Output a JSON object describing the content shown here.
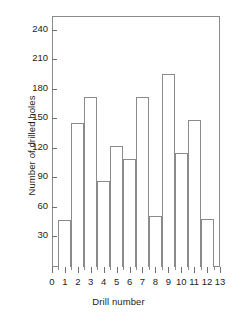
{
  "chart_data": {
    "type": "bar",
    "title": "",
    "xlabel": "Drill number",
    "ylabel": "Number of drilled holes",
    "categories": [
      "1",
      "2",
      "3",
      "4",
      "5",
      "6",
      "7",
      "8",
      "9",
      "10",
      "11",
      "12"
    ],
    "values": [
      47,
      145,
      172,
      86,
      122,
      109,
      172,
      51,
      195,
      115,
      148,
      48
    ],
    "xlim": [
      0,
      13
    ],
    "ylim": [
      0,
      255
    ],
    "yticks": [
      30,
      60,
      90,
      120,
      150,
      180,
      210,
      240
    ],
    "xticks": [
      0,
      1,
      2,
      3,
      4,
      5,
      6,
      7,
      8,
      9,
      10,
      11,
      12,
      13
    ],
    "xticklabels": [
      "0",
      "1",
      "2",
      "3",
      "4",
      "5",
      "6",
      "7",
      "8",
      "9",
      "10",
      "11",
      "12",
      "13"
    ],
    "grid": false,
    "legend": null,
    "bar_style": "outline",
    "bar_edge_color": "#8a8a8a",
    "bar_fill_color": "#ffffff",
    "axis_color": "#8a8a8a",
    "text_color": "#1d1d1d"
  }
}
